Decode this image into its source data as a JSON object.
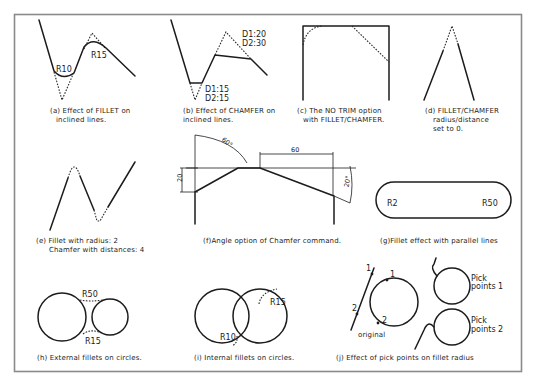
{
  "figure": {
    "panels": [
      {
        "id": "a",
        "caption": [
          "(a) Effect of FILLET on",
          "inclined lines."
        ],
        "labels": [
          "R10",
          "R15"
        ]
      },
      {
        "id": "b",
        "caption": [
          "(b) Effect of CHAMFER on",
          "inclined lines."
        ],
        "labels": [
          "D1:20",
          "D2:30",
          "D1:15",
          "D2:15"
        ]
      },
      {
        "id": "c",
        "caption": [
          "(c) The NO TRIM option",
          "with FILLET/CHAMFER."
        ],
        "labels": []
      },
      {
        "id": "d",
        "caption": [
          "(d) FILLET/CHAMFER",
          "radius/distance",
          "set to 0."
        ],
        "labels": []
      },
      {
        "id": "e",
        "caption": [
          "(e) Fillet with radius: 2",
          "Chamfer with distances: 4"
        ],
        "labels": []
      },
      {
        "id": "f",
        "caption": [
          "(f)Angle option of Chamfer command."
        ],
        "labels": [
          "60°",
          "60",
          "20",
          "20°"
        ]
      },
      {
        "id": "g",
        "caption": [
          "(g)Fillet effect with parallel lines"
        ],
        "labels": [
          "R2",
          "R50"
        ]
      },
      {
        "id": "h",
        "caption": [
          "(h) External fillets on circles."
        ],
        "labels": [
          "R50",
          "R15"
        ]
      },
      {
        "id": "i",
        "caption": [
          "(i) Internal fillets on circles."
        ],
        "labels": [
          "R15",
          "R10"
        ]
      },
      {
        "id": "j",
        "caption": [
          "(j) Effect of pick points on fillet radius"
        ],
        "labels": [
          "1",
          "1",
          "2",
          "2",
          "original",
          "Pick",
          "points 1",
          "Pick",
          "points 2"
        ]
      }
    ]
  }
}
